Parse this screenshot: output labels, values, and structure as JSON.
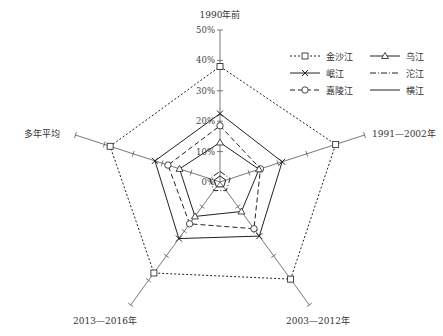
{
  "chart_data": {
    "type": "radar",
    "title": "",
    "axes": [
      "1990年前",
      "1991—2002年",
      "2003—2012年",
      "2013—2016年",
      "多年平均"
    ],
    "radial_ticks": [
      "0%",
      "10%",
      "20%",
      "30%",
      "40%",
      "50%"
    ],
    "rlim": [
      0,
      50
    ],
    "series": [
      {
        "name": "金沙江",
        "style": "dotted",
        "marker": "square",
        "values": [
          38,
          40,
          39.5,
          37,
          38
        ]
      },
      {
        "name": "岷江",
        "style": "solid",
        "marker": "x",
        "values": [
          22.5,
          21.5,
          22,
          23,
          22.5
        ]
      },
      {
        "name": "嘉陵江",
        "style": "dashed",
        "marker": "circle",
        "values": [
          18.5,
          14,
          19,
          17,
          18
        ]
      },
      {
        "name": "乌江",
        "style": "solid",
        "marker": "triangle",
        "values": [
          13,
          13.5,
          12,
          14,
          14
        ]
      },
      {
        "name": "沱江",
        "style": "dashdot",
        "marker": "none",
        "values": [
          3.5,
          3.5,
          3.5,
          3.5,
          3.5
        ]
      },
      {
        "name": "横江",
        "style": "solid",
        "marker": "none",
        "values": [
          2,
          2,
          2,
          2,
          2
        ]
      }
    ],
    "legend_position": "top-right"
  },
  "legend": [
    {
      "label": "金沙江"
    },
    {
      "label": "乌江"
    },
    {
      "label": "岷江"
    },
    {
      "label": "沱江"
    },
    {
      "label": "嘉陵江"
    },
    {
      "label": "横江"
    }
  ]
}
